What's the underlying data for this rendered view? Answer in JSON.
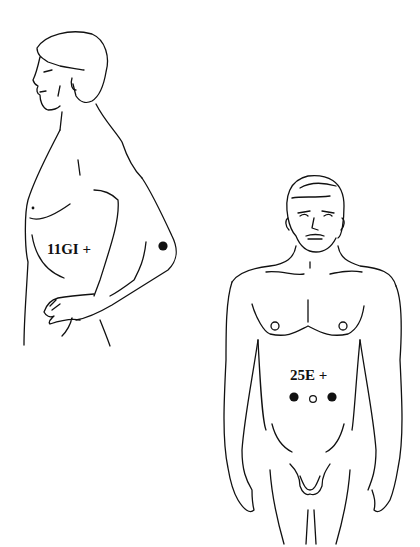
{
  "figures": [
    {
      "id": "side-profile",
      "view": "lateral",
      "point_label": "11GI +",
      "points": [
        {
          "name": "11GI",
          "marker": "filled"
        }
      ]
    },
    {
      "id": "front-view",
      "view": "anterior",
      "point_label": "25E +",
      "points": [
        {
          "name": "25E-left",
          "marker": "filled"
        },
        {
          "name": "navel",
          "marker": "hollow"
        },
        {
          "name": "25E-right",
          "marker": "filled"
        }
      ]
    }
  ],
  "colors": {
    "ink": "#111111",
    "background": "#ffffff"
  }
}
